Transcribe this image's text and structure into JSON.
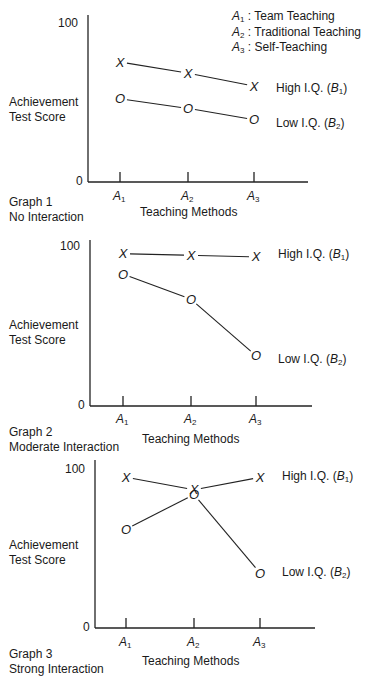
{
  "legend": {
    "items": [
      {
        "sym": "A",
        "sub": "1",
        "label": "Team Teaching"
      },
      {
        "sym": "A",
        "sub": "2",
        "label": "Traditional Teaching"
      },
      {
        "sym": "A",
        "sub": "3",
        "label": "Self-Teaching"
      }
    ]
  },
  "common": {
    "ylabel_line1": "Achievement",
    "ylabel_line2": "Test Score",
    "xlabel": "Teaching Methods",
    "y_top": "100",
    "y_bottom": "0",
    "high_label": "High I.Q. (",
    "low_label": "Low I.Q. (",
    "b1": "B",
    "b1_sub": "1",
    "b2": "B",
    "b2_sub": "2",
    "close_paren": ")",
    "tick_sym": "A",
    "ticks": [
      "1",
      "2",
      "3"
    ]
  },
  "graphs": [
    {
      "title": "Graph 1",
      "subtitle": "No Interaction"
    },
    {
      "title": "Graph 2",
      "subtitle": "Moderate Interaction"
    },
    {
      "title": "Graph 3",
      "subtitle": "Strong Interaction"
    }
  ],
  "chart_data": [
    {
      "type": "line",
      "title": "Graph 1 — No Interaction",
      "xlabel": "Teaching Methods",
      "ylabel": "Achievement Test Score",
      "categories": [
        "A1",
        "A2",
        "A3"
      ],
      "ylim": [
        0,
        100
      ],
      "grid": false,
      "series": [
        {
          "name": "High I.Q. (B1)",
          "marker": "X",
          "values": [
            75,
            68,
            60
          ]
        },
        {
          "name": "Low I.Q. (B2)",
          "marker": "O",
          "values": [
            52,
            46,
            39
          ]
        }
      ]
    },
    {
      "type": "line",
      "title": "Graph 2 — Moderate Interaction",
      "xlabel": "Teaching Methods",
      "ylabel": "Achievement Test Score",
      "categories": [
        "A1",
        "A2",
        "A3"
      ],
      "ylim": [
        0,
        100
      ],
      "grid": false,
      "series": [
        {
          "name": "High I.Q. (B1)",
          "marker": "X",
          "values": [
            97,
            96,
            95
          ]
        },
        {
          "name": "Low I.Q. (B2)",
          "marker": "O",
          "values": [
            84,
            68,
            32
          ]
        }
      ]
    },
    {
      "type": "line",
      "title": "Graph 3 — Strong Interaction",
      "xlabel": "Teaching Methods",
      "ylabel": "Achievement Test Score",
      "categories": [
        "A1",
        "A2",
        "A3"
      ],
      "ylim": [
        0,
        100
      ],
      "grid": false,
      "series": [
        {
          "name": "High I.Q. (B1)",
          "marker": "X",
          "values": [
            96,
            88,
            96
          ]
        },
        {
          "name": "Low I.Q. (B2)",
          "marker": "O",
          "values": [
            63,
            85,
            35
          ]
        }
      ]
    }
  ]
}
